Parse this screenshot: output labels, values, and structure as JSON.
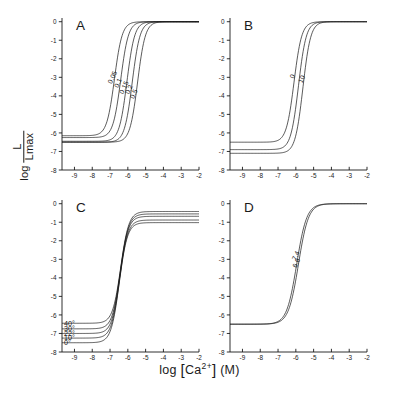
{
  "figure": {
    "axis_title_x": "log [Ca2+] (M)",
    "axis_title_y_prefix": "log",
    "axis_title_y_num": "L",
    "axis_title_y_den": "Lmax",
    "panels": [
      "A",
      "B",
      "C",
      "D"
    ]
  },
  "chart_data": [
    {
      "type": "line",
      "title": "A",
      "panel": "A",
      "xlabel": "log [Ca2+] (M)",
      "ylabel": "log L/Lmax",
      "xlim": [
        -9.7,
        -2.0
      ],
      "ylim": [
        -8.0,
        0.2
      ],
      "xticks": [
        -9,
        -8,
        -7,
        -6,
        -5,
        -4,
        -3,
        -2
      ],
      "yticks": [
        0,
        -1,
        -2,
        -3,
        -4,
        -5,
        -6,
        -7,
        -8
      ],
      "grid": false,
      "legend": "inline-curve-labels",
      "series": [
        {
          "name": "0.05",
          "label": "0.05",
          "midpoint": -6.75,
          "baseline": -6.15,
          "plateau": 0.0,
          "slope": 2.0
        },
        {
          "name": "0.10",
          "label": "0.1",
          "midpoint": -6.4,
          "baseline": -6.25,
          "plateau": 0.0,
          "slope": 2.0
        },
        {
          "name": "0.15",
          "label": "0.15",
          "midpoint": -6.05,
          "baseline": -6.45,
          "plateau": 0.0,
          "slope": 2.0
        },
        {
          "name": "0.20",
          "label": "0.2",
          "midpoint": -5.75,
          "baseline": -6.5,
          "plateau": 0.0,
          "slope": 2.0
        },
        {
          "name": "0.50",
          "label": "0.5",
          "midpoint": -5.45,
          "baseline": -6.5,
          "plateau": 0.0,
          "slope": 2.0
        }
      ]
    },
    {
      "type": "line",
      "title": "B",
      "panel": "B",
      "xlabel": "log [Ca2+] (M)",
      "ylabel": "log L/Lmax",
      "xlim": [
        -9.7,
        -2.0
      ],
      "ylim": [
        -8.0,
        0.2
      ],
      "xticks": [
        -9,
        -8,
        -7,
        -6,
        -5,
        -4,
        -3,
        -2
      ],
      "yticks": [
        0,
        -1,
        -2,
        -3,
        -4,
        -5,
        -6,
        -7,
        -8
      ],
      "grid": false,
      "legend": "inline-curve-labels",
      "series": [
        {
          "name": "0",
          "label": "0",
          "midpoint": -6.1,
          "baseline": -6.5,
          "plateau": 0.0,
          "slope": 2.0
        },
        {
          "name": "mid",
          "label": "",
          "midpoint": -5.85,
          "baseline": -6.9,
          "plateau": 0.0,
          "slope": 2.0
        },
        {
          "name": "10",
          "label": "10",
          "midpoint": -5.6,
          "baseline": -7.1,
          "plateau": 0.0,
          "slope": 2.0
        }
      ]
    },
    {
      "type": "line",
      "title": "C",
      "panel": "C",
      "xlabel": "log [Ca2+] (M)",
      "ylabel": "log L/Lmax",
      "xlim": [
        -9.7,
        -2.0
      ],
      "ylim": [
        -8.0,
        0.2
      ],
      "xticks": [
        -9,
        -8,
        -7,
        -6,
        -5,
        -4,
        -3,
        -2
      ],
      "yticks": [
        0,
        -1,
        -2,
        -3,
        -4,
        -5,
        -6,
        -7,
        -8
      ],
      "grid": false,
      "legend": "left-stacked-labels",
      "series": [
        {
          "name": "40deg",
          "label": "40°",
          "midpoint": -6.4,
          "baseline": -6.45,
          "plateau": -0.42,
          "slope": 1.9
        },
        {
          "name": "30deg",
          "label": "30°",
          "midpoint": -6.42,
          "baseline": -6.75,
          "plateau": -0.55,
          "slope": 1.9
        },
        {
          "name": "22deg",
          "label": "22°",
          "midpoint": -6.44,
          "baseline": -7.0,
          "plateau": -0.68,
          "slope": 1.9
        },
        {
          "name": "10deg",
          "label": "10°",
          "midpoint": -6.46,
          "baseline": -7.25,
          "plateau": -0.88,
          "slope": 1.9
        },
        {
          "name": "0deg",
          "label": "0°",
          "midpoint": -6.48,
          "baseline": -7.5,
          "plateau": -1.02,
          "slope": 1.9
        }
      ]
    },
    {
      "type": "line",
      "title": "D",
      "panel": "D",
      "xlabel": "log [Ca2+] (M)",
      "ylabel": "log L/Lmax",
      "xlim": [
        -9.7,
        -2.0
      ],
      "ylim": [
        -8.0,
        0.2
      ],
      "xticks": [
        -9,
        -8,
        -7,
        -6,
        -5,
        -4,
        -3,
        -2
      ],
      "yticks": [
        0,
        -1,
        -2,
        -3,
        -4,
        -5,
        -6,
        -7,
        -8
      ],
      "grid": false,
      "legend": "inline-curve-labels",
      "series": [
        {
          "name": "7.4",
          "label": "7.4",
          "midpoint": -5.95,
          "baseline": -6.5,
          "plateau": 0.0,
          "slope": 1.55
        },
        {
          "name": "6.6",
          "label": "6.6",
          "midpoint": -5.85,
          "baseline": -6.5,
          "plateau": 0.0,
          "slope": 1.55
        }
      ]
    }
  ]
}
